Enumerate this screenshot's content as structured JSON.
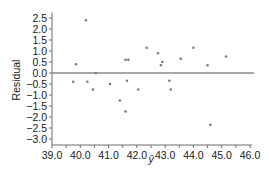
{
  "chart_data": {
    "type": "scatter",
    "title": "",
    "xlabel": "ŷ",
    "ylabel": "Residual",
    "xlim": [
      39.0,
      46.0
    ],
    "ylim": [
      -3.0,
      2.75
    ],
    "grid": false,
    "legend": null,
    "x_ticks": [
      39.0,
      40.0,
      41.0,
      42.0,
      43.0,
      44.0,
      45.0,
      46.0
    ],
    "x_tick_labels": [
      "39.0",
      "40.0",
      "41.0",
      "42.0",
      "43.0",
      "44.0",
      "45.0",
      "46.0"
    ],
    "y_ticks": [
      2.5,
      2.0,
      1.5,
      1.0,
      0.5,
      0.0,
      -0.5,
      -1.0,
      -1.5,
      -2.0,
      -2.5,
      -3.0
    ],
    "y_tick_labels": [
      "2.5",
      "2.0",
      "1.5",
      "1.0",
      "0.5",
      "0.0",
      "−0.5",
      "−1.0",
      "−1.5",
      "−2.0",
      "−2.5",
      "−3.0"
    ],
    "reference_line": {
      "y": 0.0
    },
    "series": [
      {
        "name": "residuals",
        "points": [
          {
            "x": 39.75,
            "y": -0.4
          },
          {
            "x": 39.85,
            "y": 0.4
          },
          {
            "x": 40.2,
            "y": 2.4
          },
          {
            "x": 40.25,
            "y": -0.4
          },
          {
            "x": 40.45,
            "y": -0.75
          },
          {
            "x": 40.55,
            "y": 0.0
          },
          {
            "x": 41.05,
            "y": -0.5
          },
          {
            "x": 41.4,
            "y": -1.25
          },
          {
            "x": 41.6,
            "y": -1.75
          },
          {
            "x": 41.6,
            "y": 0.6
          },
          {
            "x": 41.7,
            "y": 0.6
          },
          {
            "x": 41.65,
            "y": -0.35
          },
          {
            "x": 42.05,
            "y": -0.75
          },
          {
            "x": 42.35,
            "y": 1.15
          },
          {
            "x": 42.75,
            "y": 0.9
          },
          {
            "x": 42.85,
            "y": 0.35
          },
          {
            "x": 42.9,
            "y": 0.5
          },
          {
            "x": 43.15,
            "y": -0.35
          },
          {
            "x": 43.2,
            "y": -0.75
          },
          {
            "x": 43.55,
            "y": 0.65
          },
          {
            "x": 44.0,
            "y": 1.15
          },
          {
            "x": 44.5,
            "y": 0.35
          },
          {
            "x": 44.6,
            "y": -2.35
          },
          {
            "x": 45.15,
            "y": 0.75
          }
        ]
      }
    ]
  },
  "colors": {
    "axis": "#6e6e6e",
    "reference_line": "#8a8a8a",
    "point": "#7a7a7a",
    "text": "#1a1a1a"
  }
}
